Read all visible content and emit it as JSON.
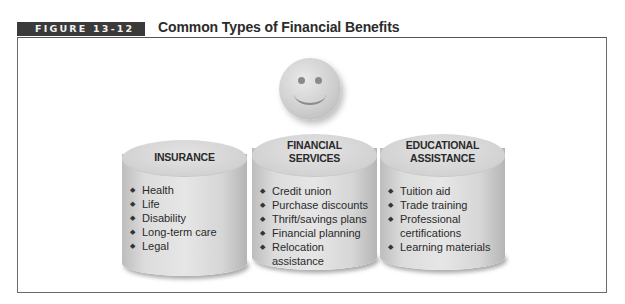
{
  "figure": {
    "label": "FIGURE 13-12",
    "title": "Common Types of Financial Benefits",
    "center_icon": "smiley-face-icon"
  },
  "categories": [
    {
      "heading_lines": [
        "INSURANCE"
      ],
      "items": [
        "Health",
        "Life",
        "Disability",
        "Long-term care",
        "Legal"
      ]
    },
    {
      "heading_lines": [
        "FINANCIAL",
        "SERVICES"
      ],
      "items": [
        "Credit union",
        "Purchase discounts",
        "Thrift/savings plans",
        "Financial planning",
        "Relocation assistance"
      ]
    },
    {
      "heading_lines": [
        "EDUCATIONAL",
        "ASSISTANCE"
      ],
      "items": [
        "Tuition aid",
        "Trade training",
        "Professional certifications",
        "Learning materials"
      ]
    }
  ]
}
